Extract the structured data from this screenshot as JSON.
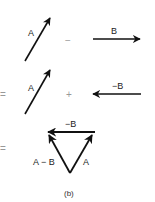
{
  "row1": {
    "vector_a_label": "A",
    "operator": "−",
    "vector_b_label": "B"
  },
  "row2": {
    "equals": "=",
    "vector_a_label": "A",
    "operator": "+",
    "vector_neg_b_label": "−B"
  },
  "row3": {
    "equals": "=",
    "top_label": "−B",
    "left_label": "A − B",
    "right_label": "A"
  },
  "caption": "(b)",
  "colors": {
    "stroke": "#111111",
    "operator": "#999999"
  }
}
